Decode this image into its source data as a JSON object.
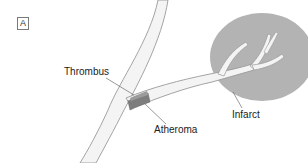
{
  "figure": {
    "panel_label": "A",
    "labels": {
      "thrombus": "Thrombus",
      "atheroma": "Atheroma",
      "infarct": "Infarct"
    },
    "colors": {
      "background": "#ffffff",
      "infarct_fill": "#b3b3b3",
      "vessel_fill": "#f4f4f4",
      "vessel_wall": "#9a9a9a",
      "atheroma_fill": "#7d7d7d",
      "thrombus_fill": "#9b9b9b",
      "leader_line": "#555555"
    }
  }
}
